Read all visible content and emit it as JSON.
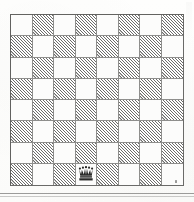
{
  "figure": {
    "kind": "chess-diagram",
    "board": {
      "files": 8,
      "ranks": 8,
      "light_square_color": "#fcfcfb",
      "dark_square_color": "#5f5f5d",
      "dark_square_fill_style": "diagonal-hatching",
      "border_color": "#6a6a68",
      "grid_line_color": "#8e8e8c",
      "top_left_square_shade": "light",
      "squares": [
        [
          "light",
          "dark",
          "light",
          "dark",
          "light",
          "dark",
          "light",
          "dark"
        ],
        [
          "dark",
          "light",
          "dark",
          "light",
          "dark",
          "light",
          "dark",
          "light"
        ],
        [
          "light",
          "dark",
          "light",
          "dark",
          "light",
          "dark",
          "light",
          "dark"
        ],
        [
          "dark",
          "light",
          "dark",
          "light",
          "dark",
          "light",
          "dark",
          "light"
        ],
        [
          "light",
          "dark",
          "light",
          "dark",
          "light",
          "dark",
          "light",
          "dark"
        ],
        [
          "dark",
          "light",
          "dark",
          "light",
          "dark",
          "light",
          "dark",
          "light"
        ],
        [
          "light",
          "dark",
          "light",
          "dark",
          "light",
          "dark",
          "light",
          "dark"
        ],
        [
          "dark",
          "light",
          "dark",
          "light",
          "dark",
          "light",
          "dark",
          "light"
        ]
      ]
    },
    "pieces": [
      {
        "glyph": "queen",
        "color": "black",
        "row": 8,
        "column": 4,
        "square_shade": "light"
      }
    ],
    "marks": [
      {
        "name": "speck",
        "description": "small ink speck near bottom-right of board"
      },
      {
        "name": "rule",
        "description": "horizontal rule below the diagram"
      }
    ]
  }
}
